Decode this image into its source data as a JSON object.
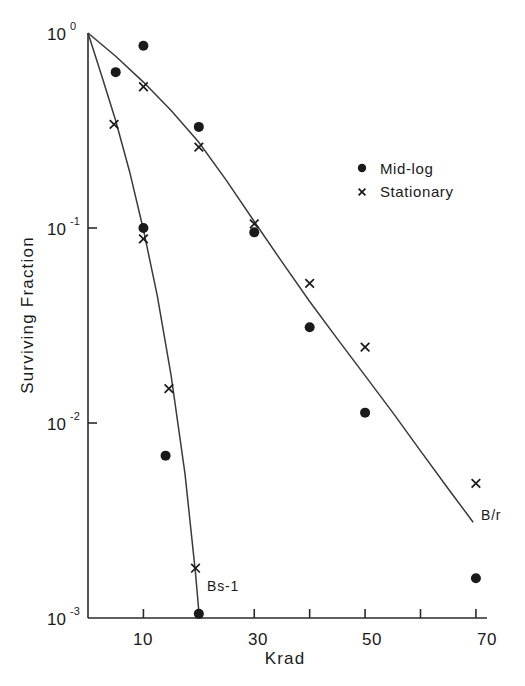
{
  "chart_data": {
    "type": "scatter",
    "title": "",
    "xlabel": "Krad",
    "ylabel": "Surviving Fraction",
    "xlim": [
      0,
      72
    ],
    "ylim": [
      0.001,
      1
    ],
    "yscale": "log",
    "xscale": "linear",
    "grid": false,
    "legend_position": "upper right",
    "x_ticks": [
      10,
      20,
      30,
      40,
      50,
      60,
      70
    ],
    "x_tick_labels": [
      "10",
      "",
      "30",
      "",
      "50",
      "",
      "70"
    ],
    "y_ticks": [
      1,
      0.1,
      0.01,
      0.001
    ],
    "y_tick_labels": [
      "10⁰",
      "10⁻¹",
      "10⁻²",
      "10⁻³"
    ],
    "y_tick_bases": [
      "10",
      "10",
      "10",
      "10"
    ],
    "y_tick_exponents": [
      "0",
      "-1",
      "-2",
      "-3"
    ],
    "legend": [
      {
        "key": "mid-log",
        "marker": "filled-circle",
        "label": "Mid-log"
      },
      {
        "key": "stationary",
        "marker": "x-cross",
        "label": "Stationary"
      }
    ],
    "annotations": [
      {
        "text": "B/r",
        "x": 70.0,
        "y": 0.0063
      },
      {
        "text": "Bs-1",
        "x": 22.5,
        "y": 0.0019
      }
    ],
    "series": [
      {
        "name": "Mid-log",
        "strain": "B/r",
        "marker": "filled-circle",
        "points": [
          {
            "x": 10.0,
            "y": 0.86
          },
          {
            "x": 20.0,
            "y": 0.33
          },
          {
            "x": 30.0,
            "y": 0.095
          },
          {
            "x": 40.0,
            "y": 0.031
          },
          {
            "x": 50.0,
            "y": 0.0113
          },
          {
            "x": 70.0,
            "y": 0.0016
          }
        ]
      },
      {
        "name": "Stationary",
        "strain": "B/r",
        "marker": "x-cross",
        "points": [
          {
            "x": 10.0,
            "y": 0.53
          },
          {
            "x": 20.0,
            "y": 0.26
          },
          {
            "x": 30.0,
            "y": 0.105
          },
          {
            "x": 40.0,
            "y": 0.052
          },
          {
            "x": 50.0,
            "y": 0.0245
          },
          {
            "x": 70.0,
            "y": 0.0049
          }
        ]
      },
      {
        "name": "Mid-log",
        "strain": "Bs-1",
        "marker": "filled-circle",
        "points": [
          {
            "x": 5.0,
            "y": 0.63
          },
          {
            "x": 10.0,
            "y": 0.1
          },
          {
            "x": 14.0,
            "y": 0.0068
          },
          {
            "x": 20.0,
            "y": 0.00105
          }
        ]
      },
      {
        "name": "Stationary",
        "strain": "Bs-1",
        "marker": "x-cross",
        "points": [
          {
            "x": 4.7,
            "y": 0.34
          },
          {
            "x": 10.0,
            "y": 0.088
          },
          {
            "x": 14.6,
            "y": 0.015
          },
          {
            "x": 19.4,
            "y": 0.0018
          }
        ]
      }
    ],
    "fitted_curves": [
      {
        "name": "B/r",
        "points": [
          {
            "x": 0.0,
            "y": 1.0
          },
          {
            "x": 5.0,
            "y": 0.76
          },
          {
            "x": 10.0,
            "y": 0.56
          },
          {
            "x": 15.0,
            "y": 0.4
          },
          {
            "x": 20.0,
            "y": 0.275
          },
          {
            "x": 25.0,
            "y": 0.175
          },
          {
            "x": 30.0,
            "y": 0.108
          },
          {
            "x": 35.0,
            "y": 0.067
          },
          {
            "x": 40.0,
            "y": 0.042
          },
          {
            "x": 45.0,
            "y": 0.027
          },
          {
            "x": 50.0,
            "y": 0.0175
          },
          {
            "x": 55.0,
            "y": 0.0113
          },
          {
            "x": 60.0,
            "y": 0.0072
          },
          {
            "x": 65.0,
            "y": 0.0046
          },
          {
            "x": 69.5,
            "y": 0.0031
          }
        ]
      },
      {
        "name": "Bs-1",
        "points": [
          {
            "x": 0.0,
            "y": 1.0
          },
          {
            "x": 2.5,
            "y": 0.6
          },
          {
            "x": 5.0,
            "y": 0.355
          },
          {
            "x": 7.5,
            "y": 0.195
          },
          {
            "x": 10.0,
            "y": 0.098
          },
          {
            "x": 12.5,
            "y": 0.045
          },
          {
            "x": 15.0,
            "y": 0.0175
          },
          {
            "x": 17.5,
            "y": 0.0055
          },
          {
            "x": 19.4,
            "y": 0.0017
          },
          {
            "x": 20.0,
            "y": 0.00108
          }
        ]
      }
    ]
  },
  "axes": {
    "y_axis_title": "Surviving Fraction",
    "x_axis_title": "Krad"
  },
  "legend": {
    "mid_log_label": "Mid-log",
    "stationary_label": "Stationary"
  },
  "curve_labels": {
    "br": "B/r",
    "bs1": "Bs-1"
  },
  "y_tick_text": {
    "t0_base": "10",
    "t0_exp": "0",
    "t1_base": "10",
    "t1_exp": "-1",
    "t2_base": "10",
    "t2_exp": "-2",
    "t3_base": "10",
    "t3_exp": "-3"
  },
  "x_tick_text": {
    "t10": "10",
    "t30": "30",
    "t50": "50",
    "t70": "70"
  },
  "colors": {
    "ink": "#1a1a1a",
    "curve": "#3a3a3a",
    "background": "#ffffff"
  }
}
